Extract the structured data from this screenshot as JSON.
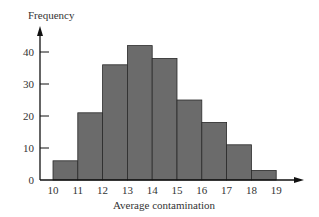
{
  "chart_data": {
    "type": "bar",
    "title": "",
    "xlabel": "Average contamination",
    "ylabel": "Frequency",
    "bin_edges": [
      10,
      11,
      12,
      13,
      14,
      15,
      16,
      17,
      18,
      19
    ],
    "categories": [
      "10-11",
      "11-12",
      "12-13",
      "13-14",
      "14-15",
      "15-16",
      "16-17",
      "17-18",
      "18-19"
    ],
    "values": [
      6,
      21,
      36,
      42,
      38,
      25,
      18,
      11,
      3
    ],
    "x_ticks": [
      "10",
      "11",
      "12",
      "13",
      "14",
      "15",
      "16",
      "17",
      "18",
      "19"
    ],
    "y_ticks": [
      "0",
      "10",
      "20",
      "30",
      "40"
    ],
    "ylim": [
      0,
      45
    ],
    "xlim": [
      10,
      19
    ],
    "grid": false,
    "legend": null,
    "bar_color": "#6b6b6b",
    "edge_color": "#2a2a2a"
  }
}
